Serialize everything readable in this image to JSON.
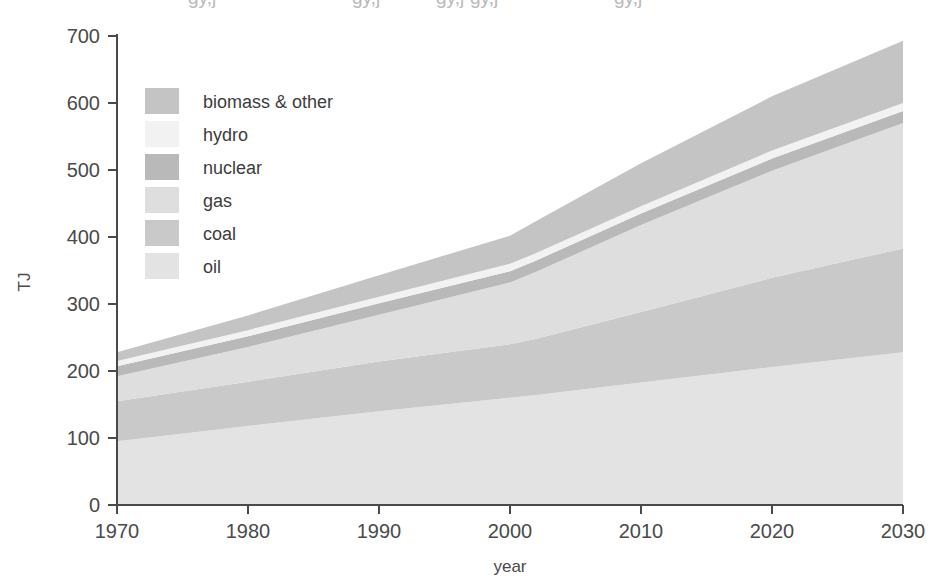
{
  "chart_data": {
    "type": "area",
    "stacked": true,
    "title": "",
    "xlabel": "year",
    "ylabel": "TJ",
    "xlim": [
      1970,
      2030
    ],
    "ylim": [
      0,
      700
    ],
    "grid": false,
    "legend_position": "inside upper-left",
    "x_ticks": [
      1970,
      1980,
      1990,
      2000,
      2010,
      2020,
      2030
    ],
    "x_tick_labels": [
      "1970",
      "1980",
      "1990",
      "2000",
      "2010",
      "2020",
      "2030"
    ],
    "y_ticks": [
      0,
      100,
      200,
      300,
      400,
      500,
      600,
      700
    ],
    "y_tick_labels": [
      "0",
      "100",
      "200",
      "300",
      "400",
      "500",
      "600",
      "700"
    ],
    "x": [
      1970,
      1980,
      1990,
      2000,
      2002,
      2010,
      2020,
      2030
    ],
    "series": [
      {
        "name": "oil",
        "color": "#e3e3e3",
        "values": [
          95,
          118,
          140,
          160,
          164,
          183,
          206,
          228
        ]
      },
      {
        "name": "coal",
        "color": "#c9c9c9",
        "values": [
          60,
          66,
          74,
          80,
          84,
          105,
          133,
          155
        ]
      },
      {
        "name": "gas",
        "color": "#dedede",
        "values": [
          37,
          52,
          70,
          92,
          100,
          130,
          160,
          187
        ]
      },
      {
        "name": "nuclear",
        "color": "#b9b9b9",
        "values": [
          15,
          16,
          17,
          17,
          17,
          17,
          18,
          18
        ]
      },
      {
        "name": "hydro",
        "color": "#f2f2f2",
        "values": [
          8,
          9,
          10,
          11,
          11,
          11,
          12,
          12
        ]
      },
      {
        "name": "biomass & other",
        "color": "#c4c4c4",
        "values": [
          13,
          22,
          32,
          42,
          48,
          64,
          81,
          93
        ]
      }
    ],
    "cumulative_tops": {
      "oil": [
        95,
        118,
        140,
        160,
        164,
        183,
        206,
        228
      ],
      "coal": [
        155,
        184,
        214,
        240,
        248,
        288,
        339,
        383
      ],
      "gas": [
        192,
        236,
        284,
        332,
        348,
        418,
        499,
        570
      ],
      "nuclear": [
        207,
        252,
        301,
        349,
        365,
        435,
        517,
        588
      ],
      "hydro": [
        215,
        261,
        311,
        360,
        376,
        446,
        529,
        600
      ],
      "biomass & other": [
        228,
        283,
        343,
        402,
        424,
        510,
        610,
        693
      ]
    },
    "legend_order_displayed": [
      "biomass & other",
      "hydro",
      "nuclear",
      "gas",
      "coal",
      "oil"
    ]
  },
  "axes": {
    "y_title": "TJ",
    "x_title": "year"
  }
}
